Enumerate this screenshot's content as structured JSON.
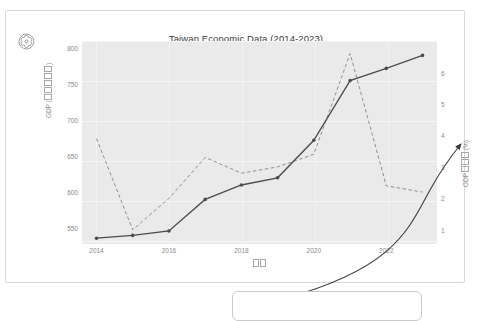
{
  "window": {
    "background": "#ffffff"
  },
  "logo": {
    "name": "openai-logo",
    "alt": "logo"
  },
  "chart_data": {
    "type": "line",
    "title": "Taiwan Economic Data (2014-2023)",
    "xlabel": "□□",
    "ylabel": "GDP (□□□□□)",
    "ylabel_right": "GDP□□□ (%)",
    "x": [
      2014,
      2015,
      2016,
      2017,
      2018,
      2019,
      2020,
      2021,
      2022,
      2023
    ],
    "xticks": [
      "2014",
      "2016",
      "2018",
      "2020",
      "2022"
    ],
    "xtick_values": [
      2014,
      2016,
      2018,
      2020,
      2022
    ],
    "xlim": [
      2013.6,
      2023.4
    ],
    "yticks": [
      "550",
      "600",
      "650",
      "700",
      "750",
      "800"
    ],
    "ytick_values": [
      550,
      600,
      650,
      700,
      750,
      800
    ],
    "ylim": [
      528,
      810
    ],
    "yticks_right": [
      "1",
      "2",
      "3",
      "4",
      "5",
      "6"
    ],
    "ytick_right_values": [
      1,
      2,
      3,
      4,
      5,
      6
    ],
    "ylim_right": [
      0.55,
      7.0
    ],
    "grid": true,
    "legend": "none",
    "series": [
      {
        "name": "GDP",
        "style": "solid",
        "marker": "circle",
        "color": "#4a4a52",
        "axis": "left",
        "values": [
          536,
          540,
          546,
          590,
          610,
          620,
          672,
          755,
          772,
          790
        ]
      },
      {
        "name": "GDP growth rate",
        "style": "dashed",
        "marker": "none",
        "color": "#8f8f97",
        "axis": "right",
        "values": [
          3.9,
          1.0,
          2.0,
          3.3,
          2.8,
          3.0,
          3.4,
          6.6,
          2.4,
          2.2
        ]
      }
    ]
  },
  "callout": {
    "label": "",
    "pointer": "curved-arrow"
  }
}
